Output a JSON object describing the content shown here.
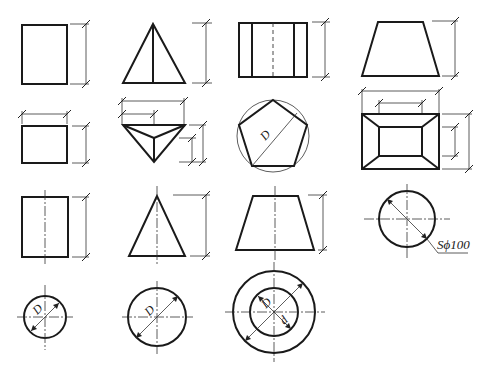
{
  "diagram": {
    "labels": {
      "pentagon_circumscribed": "D",
      "sphere": "Sϕ100",
      "circle_small": "D",
      "circle_medium": "D",
      "ring_inner": "D",
      "ring_outer_inner_dim": "d"
    },
    "rows": [
      {
        "row": 1,
        "items": [
          "prism-front-rect",
          "pyramid-front-triangle",
          "pentagonal-prism-front",
          "frustum-front-trapezoid"
        ]
      },
      {
        "row": 2,
        "items": [
          "prism-top-rect",
          "pyramid-top-triangle",
          "pentagonal-prism-top",
          "frustum-top-rect"
        ]
      },
      {
        "row": 3,
        "items": [
          "cylinder-front-rect",
          "cone-front-triangle",
          "truncated-cone-front",
          "sphere-circle"
        ]
      },
      {
        "row": 4,
        "items": [
          "cylinder-top-circle",
          "cone-top-circle",
          "truncated-cone-top-rings"
        ]
      }
    ],
    "colors": {
      "line": "#1a1a1a",
      "background": "#ffffff"
    }
  }
}
